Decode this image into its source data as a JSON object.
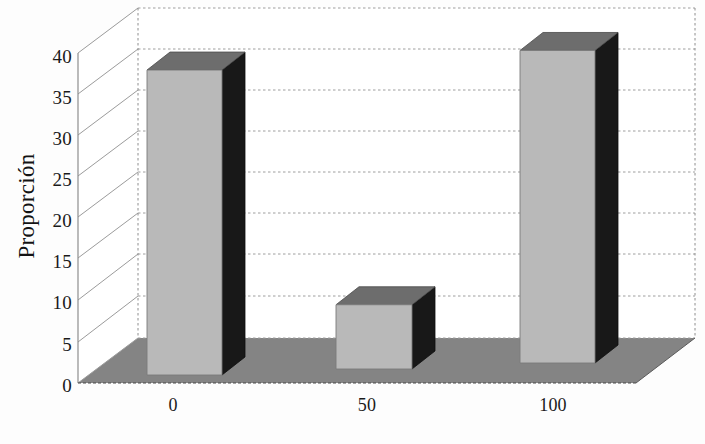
{
  "chart_data": {
    "type": "bar",
    "title": "",
    "subtitle": "",
    "xlabel": "",
    "ylabel": "Proporción",
    "categories": [
      "0",
      "50",
      "100"
    ],
    "values": [
      38.4,
      9.6,
      40.8
    ],
    "series": [
      {
        "name": "Proporción",
        "values": [
          38.4,
          9.6,
          40.8
        ]
      }
    ],
    "ylim": [
      0,
      40
    ],
    "yticks": [
      0,
      5,
      10,
      15,
      20,
      25,
      30,
      35,
      40
    ],
    "ytick_labels": [
      "0",
      "5",
      "10",
      "15",
      "20",
      "25",
      "30",
      "35",
      "40"
    ],
    "xtick_labels": [
      "0",
      "50",
      "100"
    ],
    "grid": true,
    "grid_axis": "y",
    "legend": false,
    "legend_position": "none",
    "projection": "3d",
    "annotations": []
  },
  "style": {
    "bar_front_color": "#b9b9b9",
    "bar_top_color": "#6d6d6d",
    "bar_side_color": "#181818",
    "floor_color": "#848484",
    "grid_color": "#9a9a9a",
    "wall_line_color": "#8e8e8e",
    "text_color": "#141414",
    "background_color": "#fdfdfd"
  },
  "axis": {
    "y_title": "Proporción",
    "x_title": ""
  }
}
